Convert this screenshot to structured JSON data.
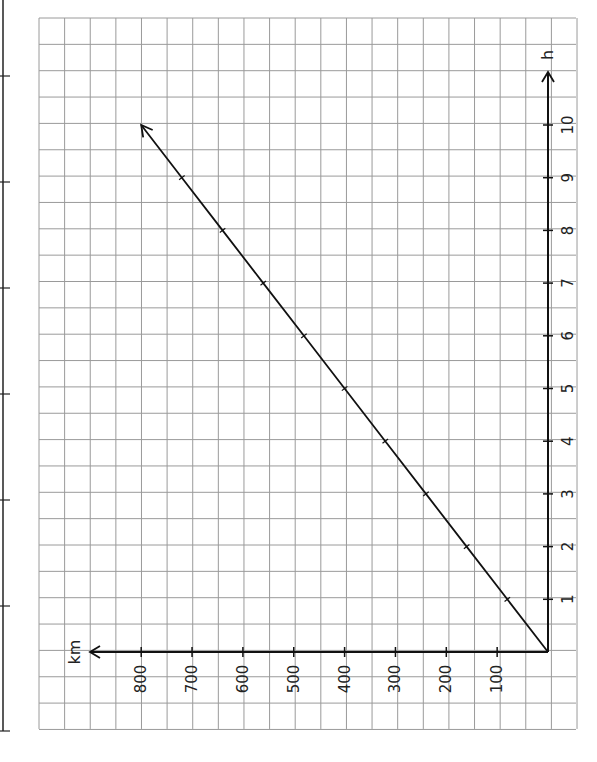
{
  "chart_data": {
    "type": "line",
    "orientation": "rotated-90-ccw",
    "title": "",
    "xlabel": "h",
    "ylabel": "km",
    "x": [
      0,
      1,
      2,
      3,
      4,
      5,
      6,
      7,
      8,
      9,
      10
    ],
    "series": [
      {
        "name": "distance",
        "values": [
          0,
          80,
          160,
          240,
          320,
          400,
          480,
          560,
          640,
          720,
          800
        ]
      }
    ],
    "x_ticks": [
      "1",
      "2",
      "3",
      "4",
      "5",
      "6",
      "7",
      "8",
      "9",
      "10"
    ],
    "y_ticks": [
      "100",
      "200",
      "300",
      "400",
      "500",
      "600",
      "700",
      "800"
    ],
    "xlim": [
      0,
      11
    ],
    "ylim": [
      0,
      850
    ],
    "grid": true,
    "legend": "none",
    "line_end_arrow": true
  },
  "colors": {
    "grid": "#9a9a9a",
    "axis": "#111111",
    "line": "#111111",
    "text": "#222222",
    "page_border": "#222222"
  },
  "layout": {
    "grid_left": 39,
    "grid_top": 18,
    "grid_cols": 21,
    "grid_rows": 27,
    "cell_w": 25.62,
    "cell_h": 26.35,
    "origin_x": 548,
    "origin_y": 652,
    "px_per_km": 0.5085,
    "px_per_hour": 52.7,
    "page_border_x": 3,
    "page_border_ticks_y": [
      76,
      182,
      288,
      394,
      500,
      606,
      731
    ]
  }
}
